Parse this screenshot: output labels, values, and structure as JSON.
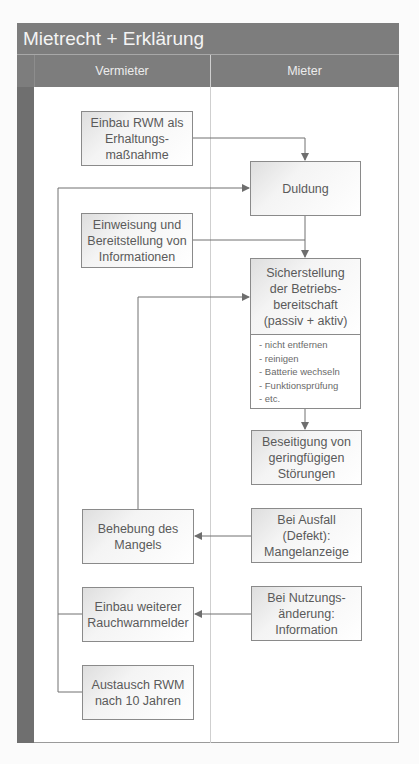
{
  "title": "Mietrecht + Erklärung",
  "columns": {
    "left": "Vermieter",
    "right": "Mieter"
  },
  "boxes": {
    "einbau_rwm": "Einbau RWM als\nErhaltungs-\nmaßnahme",
    "duldung": "Duldung",
    "einweisung": "Einweisung und\nBereitstellung von\nInformationen",
    "sicherstellung": "Sicherstellung\nder Betriebs-\nbereitschaft\n(passiv + aktiv)",
    "sicherstellung_items": [
      "- nicht entfernen",
      "- reinigen",
      "- Batterie wechseln",
      "- Funktionsprüfung",
      "- etc."
    ],
    "beseitigung": "Beseitigung von\ngeringfügigen\nStörungen",
    "behebung": "Behebung des\nMangels",
    "ausfall": "Bei Ausfall\n(Defekt):\nMangelanzeige",
    "einbau_weiterer": "Einbau weiterer\nRauchwarnmelder",
    "nutzungsaenderung": "Bei Nutzungs-\nänderung:\nInformation",
    "austausch": "Austausch RWM\nnach 10 Jahren"
  },
  "colors": {
    "header": "#7d7d7d",
    "strip": "#6f6f6f",
    "line": "#707070",
    "text": "#5a5a5a"
  }
}
